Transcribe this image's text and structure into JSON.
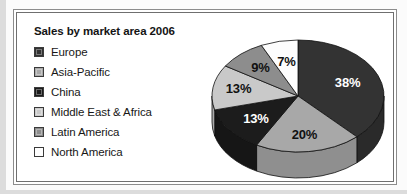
{
  "figure": {
    "title": "Sales by market area 2006"
  },
  "legend": {
    "items": [
      {
        "label": "Europe",
        "swatch": "#333333",
        "icon": "legend-swatch-icon"
      },
      {
        "label": "Asia-Pacific",
        "swatch": "#a8a8a8",
        "icon": "legend-swatch-icon"
      },
      {
        "label": "China",
        "swatch": "#1c1c1c",
        "icon": "legend-swatch-icon"
      },
      {
        "label": "Middle East & Africa",
        "swatch": "#c9c9c9",
        "icon": "legend-swatch-icon"
      },
      {
        "label": "Latin America",
        "swatch": "#8d8d8d",
        "icon": "legend-swatch-icon"
      },
      {
        "label": "North America",
        "swatch": "#fdfdfd",
        "icon": "legend-swatch-icon"
      }
    ]
  },
  "chart_data": {
    "type": "pie",
    "title": "Sales by market area 2006",
    "xlabel": "",
    "ylabel": "",
    "unit": "%",
    "total": 100,
    "start_angle_deg": 0,
    "direction": "clockwise",
    "three_d": true,
    "legend_position": "left",
    "grid": false,
    "categories": [
      "Europe",
      "Asia-Pacific",
      "China",
      "Middle East & Africa",
      "Latin America",
      "North America"
    ],
    "values": [
      38,
      20,
      13,
      13,
      9,
      7
    ],
    "labels": [
      "38%",
      "20%",
      "13%",
      "13%",
      "9%",
      "7%"
    ],
    "colors": [
      "#333333",
      "#a8a8a8",
      "#1c1c1c",
      "#c9c9c9",
      "#8d8d8d",
      "#fdfdfd"
    ],
    "slices": [
      {
        "name": "Europe",
        "value": 38,
        "label": "38%",
        "color": "#333333",
        "side_color": "#2a2a2a",
        "label_style": "light"
      },
      {
        "name": "Asia-Pacific",
        "value": 20,
        "label": "20%",
        "color": "#a8a8a8",
        "side_color": "#8f8f8f",
        "label_style": "dark"
      },
      {
        "name": "China",
        "value": 13,
        "label": "13%",
        "color": "#1c1c1c",
        "side_color": "#161616",
        "label_style": "light"
      },
      {
        "name": "Middle East & Africa",
        "value": 13,
        "label": "13%",
        "color": "#c9c9c9",
        "side_color": "#ababab",
        "label_style": "dark"
      },
      {
        "name": "Latin America",
        "value": 9,
        "label": "9%",
        "color": "#8d8d8d",
        "side_color": "#767676",
        "label_style": "dark"
      },
      {
        "name": "North America",
        "value": 7,
        "label": "7%",
        "color": "#fdfdfd",
        "side_color": "#dcdcdc",
        "label_style": "dark"
      }
    ]
  }
}
